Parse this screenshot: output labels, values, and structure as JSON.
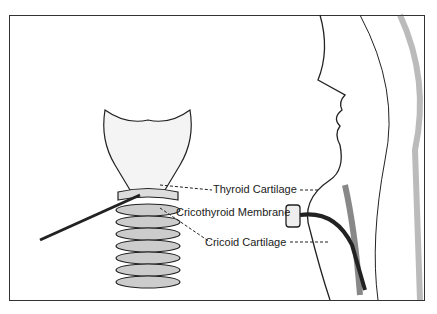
{
  "diagram": {
    "labels": [
      {
        "id": "thyroid",
        "text": "Thyroid Cartilage"
      },
      {
        "id": "membrane",
        "text": "Cricothyroid Membrane"
      },
      {
        "id": "cricoid",
        "text": "Cricoid Cartilage"
      }
    ]
  }
}
